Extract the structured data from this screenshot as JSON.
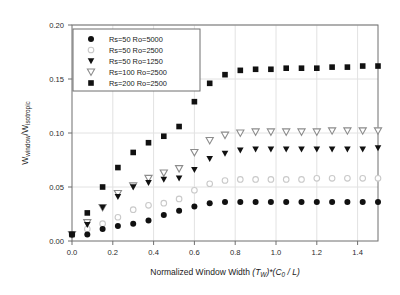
{
  "chart_data": {
    "type": "scatter",
    "title": "",
    "xlabel": "Normalized Window Width (TW)*(C0 / L)",
    "ylabel": "Wwindow/Wisotropic",
    "xlim": [
      0.0,
      1.5
    ],
    "ylim": [
      0.0,
      0.2
    ],
    "xticks": [
      "0.0",
      "0.2",
      "0.4",
      "0.6",
      "0.8",
      "1.0",
      "1.2",
      "1.4"
    ],
    "xtick_values": [
      0.0,
      0.2,
      0.4,
      0.6,
      0.8,
      1.0,
      1.2,
      1.4
    ],
    "yticks": [
      "0.00",
      "0.05",
      "0.10",
      "0.15",
      "0.20"
    ],
    "ytick_values": [
      0.0,
      0.05,
      0.1,
      0.15,
      0.2
    ],
    "grid": true,
    "legend_position": "top-left",
    "x": [
      0.0,
      0.075,
      0.15,
      0.225,
      0.3,
      0.375,
      0.45,
      0.525,
      0.6,
      0.675,
      0.75,
      0.825,
      0.9,
      0.975,
      1.05,
      1.125,
      1.2,
      1.275,
      1.35,
      1.425,
      1.5
    ],
    "series": [
      {
        "name": "Rs=50 Ro=5000",
        "marker": "filled-circle",
        "color": "#111111",
        "values": [
          0.006,
          0.006,
          0.011,
          0.014,
          0.016,
          0.019,
          0.024,
          0.028,
          0.032,
          0.035,
          0.036,
          0.036,
          0.036,
          0.036,
          0.036,
          0.036,
          0.036,
          0.036,
          0.036,
          0.036,
          0.036
        ]
      },
      {
        "name": "Rs=50 Ro=2500",
        "marker": "open-circle",
        "color": "#c9c9c9",
        "values": [
          0.006,
          0.011,
          0.016,
          0.022,
          0.029,
          0.033,
          0.035,
          0.039,
          0.047,
          0.053,
          0.056,
          0.057,
          0.057,
          0.057,
          0.057,
          0.057,
          0.058,
          0.058,
          0.058,
          0.058,
          0.058
        ]
      },
      {
        "name": "Rs=50 Ro=1250",
        "marker": "filled-triangle-down",
        "color": "#111111",
        "values": [
          0.006,
          0.015,
          0.031,
          0.041,
          0.05,
          0.054,
          0.057,
          0.058,
          0.066,
          0.076,
          0.081,
          0.084,
          0.085,
          0.085,
          0.085,
          0.085,
          0.085,
          0.085,
          0.085,
          0.085,
          0.086
        ]
      },
      {
        "name": "Rs=100 Ro=2500",
        "marker": "open-triangle-down",
        "color": "#8c8c8c",
        "values": [
          0.006,
          0.017,
          0.031,
          0.044,
          0.051,
          0.058,
          0.063,
          0.067,
          0.082,
          0.093,
          0.098,
          0.1,
          0.101,
          0.101,
          0.101,
          0.101,
          0.101,
          0.102,
          0.102,
          0.102,
          0.102
        ]
      },
      {
        "name": "Rs=200 Ro=2500",
        "marker": "filled-square",
        "color": "#111111",
        "values": [
          0.006,
          0.026,
          0.05,
          0.068,
          0.082,
          0.091,
          0.097,
          0.106,
          0.129,
          0.146,
          0.154,
          0.158,
          0.159,
          0.159,
          0.16,
          0.16,
          0.16,
          0.161,
          0.161,
          0.162,
          0.162
        ]
      }
    ]
  },
  "legend": {
    "items": [
      {
        "label": "Rs=50 Ro=5000"
      },
      {
        "label": "Rs=50 Ro=2500"
      },
      {
        "label": "Rs=50 Ro=1250"
      },
      {
        "label": "Rs=100 Ro=2500"
      },
      {
        "label": "Rs=200 Ro=2500"
      }
    ]
  },
  "axis_label_parts": {
    "x_main": "Normalized Window Width ",
    "x_t": "T",
    "x_w_sub": "W",
    "x_star": ")*(",
    "x_c": "C",
    "x_zero_sub": "0",
    "x_slash_l": " / L)",
    "x_open_paren": "(",
    "y_w1": "W",
    "y_sub1": "window",
    "y_slash": "/",
    "y_w2": "W",
    "y_sub2": "isotropic"
  },
  "colors": {
    "frame": "#6f6f6f",
    "grid": "#e2e2e2",
    "text": "#1a1a1a",
    "marker_dark": "#111111",
    "marker_light": "#c9c9c9",
    "marker_mid": "#8c8c8c",
    "background": "#ffffff"
  }
}
